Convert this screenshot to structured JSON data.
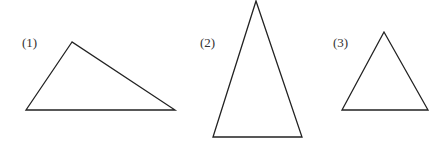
{
  "figures": [
    {
      "label": "(1)",
      "kind": "obtuse-scalene-triangle",
      "label_pos": [
        22,
        47
      ],
      "points": "72,42 26,110 175,110"
    },
    {
      "label": "(2)",
      "kind": "acute-isosceles-triangle",
      "label_pos": [
        200,
        47
      ],
      "points": "256,1 213,137 302,137"
    },
    {
      "label": "(3)",
      "kind": "equilateral-triangle",
      "label_pos": [
        333,
        47
      ],
      "points": "384,32 342,110 428,110"
    }
  ],
  "colors": {
    "stroke": "#222222",
    "label": "#333333",
    "background": "#ffffff"
  }
}
